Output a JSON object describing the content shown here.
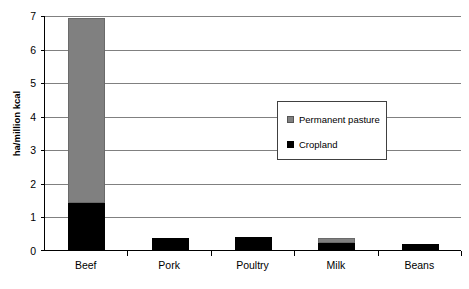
{
  "chart_data": {
    "type": "bar",
    "subtype": "stacked-bar",
    "title": "",
    "xlabel": "",
    "ylabel": "ha/million kcal",
    "ylim": [
      0,
      7
    ],
    "yticks": [
      0,
      1,
      2,
      3,
      4,
      5,
      6,
      7
    ],
    "ytick_labels": [
      "0",
      "1",
      "2",
      "3",
      "4",
      "5",
      "6",
      "7"
    ],
    "grid": true,
    "grid_axis": "y",
    "legend_position": "center-right-inside",
    "categories": [
      "Beef",
      "Pork",
      "Poultry",
      "Milk",
      "Beans"
    ],
    "series": [
      {
        "name": "Cropland",
        "color": "#000000",
        "values": [
          1.4,
          0.35,
          0.4,
          0.2,
          0.18
        ]
      },
      {
        "name": "Permanent pasture",
        "color": "#808080",
        "values": [
          5.5,
          0.0,
          0.0,
          0.15,
          0.0
        ]
      }
    ],
    "totals": [
      6.9,
      0.35,
      0.4,
      0.35,
      0.18
    ],
    "stack_order": [
      "Cropland",
      "Permanent pasture"
    ]
  },
  "axis": {
    "y_title": "ha/million kcal",
    "y_tick_labels": [
      "7",
      "6",
      "5",
      "4",
      "3",
      "2",
      "1",
      "0"
    ],
    "x_tick_labels": [
      "Beef",
      "Pork",
      "Poultry",
      "Milk",
      "Beans"
    ]
  },
  "legend": {
    "items": [
      {
        "label": "Permanent pasture",
        "color": "#808080"
      },
      {
        "label": "Cropland",
        "color": "#000000"
      }
    ]
  },
  "colors": {
    "pasture": "#808080",
    "cropland": "#000000",
    "gridline": "#808080",
    "axis": "#000000",
    "background": "#ffffff"
  }
}
